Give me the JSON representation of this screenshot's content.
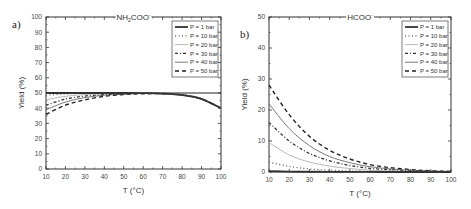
{
  "chart_data": [
    {
      "panel_label": "a)",
      "type": "line",
      "title": "NH2COO-",
      "title_main": "NH",
      "title_sub": "2",
      "title_rest": "COO",
      "title_sup": "-",
      "xlabel": "T (°C)",
      "ylabel": "Yield (%)",
      "xlim": [
        10,
        100
      ],
      "ylim": [
        0,
        100
      ],
      "xticks": [
        10,
        20,
        30,
        40,
        50,
        60,
        70,
        80,
        90,
        100
      ],
      "yticks": [
        0,
        10,
        20,
        30,
        40,
        50,
        60,
        70,
        80,
        90,
        100
      ],
      "grid": false,
      "legend_position": "upper right",
      "reference_line": 50,
      "x": [
        10,
        20,
        30,
        40,
        50,
        60,
        70,
        80,
        90,
        100
      ],
      "series": [
        {
          "name": "P = 1 bar",
          "style": "solid-thick",
          "values": [
            50.0,
            50.0,
            50.0,
            50.0,
            50.0,
            49.9,
            49.6,
            48.6,
            46.0,
            40.0
          ]
        },
        {
          "name": "P = 10 bar",
          "style": "dotted",
          "values": [
            48.5,
            49.4,
            49.8,
            49.9,
            50.0,
            50.0,
            49.8,
            49.0,
            46.5,
            40.0
          ]
        },
        {
          "name": "P = 20 bar",
          "style": "solid-light",
          "values": [
            45.5,
            47.8,
            49.0,
            49.6,
            49.8,
            49.9,
            49.7,
            48.9,
            46.3,
            40.0
          ]
        },
        {
          "name": "P = 30 bar",
          "style": "dash-dot",
          "values": [
            42.0,
            46.0,
            48.0,
            49.0,
            49.5,
            49.8,
            49.6,
            48.8,
            46.2,
            40.0
          ]
        },
        {
          "name": "P = 40 bar",
          "style": "solid-thin",
          "values": [
            39.0,
            44.0,
            47.0,
            48.5,
            49.3,
            49.7,
            49.6,
            48.7,
            46.1,
            40.0
          ]
        },
        {
          "name": "P = 50 bar",
          "style": "dashed",
          "values": [
            36.0,
            42.0,
            45.5,
            47.8,
            49.0,
            49.5,
            49.5,
            48.7,
            46.0,
            40.0
          ]
        }
      ]
    },
    {
      "panel_label": "b)",
      "type": "line",
      "title": "HCOO-",
      "title_main": "HCOO",
      "title_sup": "-",
      "xlabel": "T (°C)",
      "ylabel": "Yield (%)",
      "xlim": [
        10,
        100
      ],
      "ylim": [
        0,
        50
      ],
      "xticks": [
        10,
        20,
        30,
        40,
        50,
        60,
        70,
        80,
        90,
        100
      ],
      "yticks": [
        0,
        10,
        20,
        30,
        40,
        50
      ],
      "grid": false,
      "legend_position": "upper right",
      "x": [
        10,
        20,
        30,
        40,
        50,
        60,
        70,
        80,
        90,
        100
      ],
      "series": [
        {
          "name": "P = 1 bar",
          "style": "solid-thick",
          "values": [
            0.3,
            0.15,
            0.08,
            0.04,
            0.02,
            0.01,
            0.0,
            0.0,
            0.0,
            0.0
          ]
        },
        {
          "name": "P = 10 bar",
          "style": "dotted",
          "values": [
            3.2,
            1.8,
            1.0,
            0.6,
            0.35,
            0.2,
            0.1,
            0.05,
            0.02,
            0.0
          ]
        },
        {
          "name": "P = 20 bar",
          "style": "solid-light",
          "values": [
            9.5,
            5.5,
            3.2,
            1.9,
            1.1,
            0.6,
            0.35,
            0.2,
            0.1,
            0.05
          ]
        },
        {
          "name": "P = 30 bar",
          "style": "dash-dot",
          "values": [
            16.0,
            10.0,
            6.0,
            3.6,
            2.1,
            1.2,
            0.7,
            0.4,
            0.2,
            0.1
          ]
        },
        {
          "name": "P = 40 bar",
          "style": "solid-thin",
          "values": [
            22.0,
            14.0,
            8.5,
            5.0,
            3.0,
            1.7,
            1.0,
            0.55,
            0.3,
            0.15
          ]
        },
        {
          "name": "P = 50 bar",
          "style": "dashed",
          "values": [
            28.0,
            18.5,
            11.5,
            7.0,
            4.2,
            2.4,
            1.4,
            0.8,
            0.4,
            0.2
          ]
        }
      ]
    }
  ],
  "styles": {
    "solid-thick": {
      "color": "#333333",
      "width": 1.8,
      "dash": ""
    },
    "dotted": {
      "color": "#555555",
      "width": 1.2,
      "dash": "1,2.5"
    },
    "solid-light": {
      "color": "#b8b8b8",
      "width": 1.0,
      "dash": ""
    },
    "dash-dot": {
      "color": "#333333",
      "width": 1.3,
      "dash": "3,2,1,2"
    },
    "solid-thin": {
      "color": "#555555",
      "width": 0.8,
      "dash": ""
    },
    "dashed": {
      "color": "#222222",
      "width": 1.4,
      "dash": "4,3"
    }
  }
}
